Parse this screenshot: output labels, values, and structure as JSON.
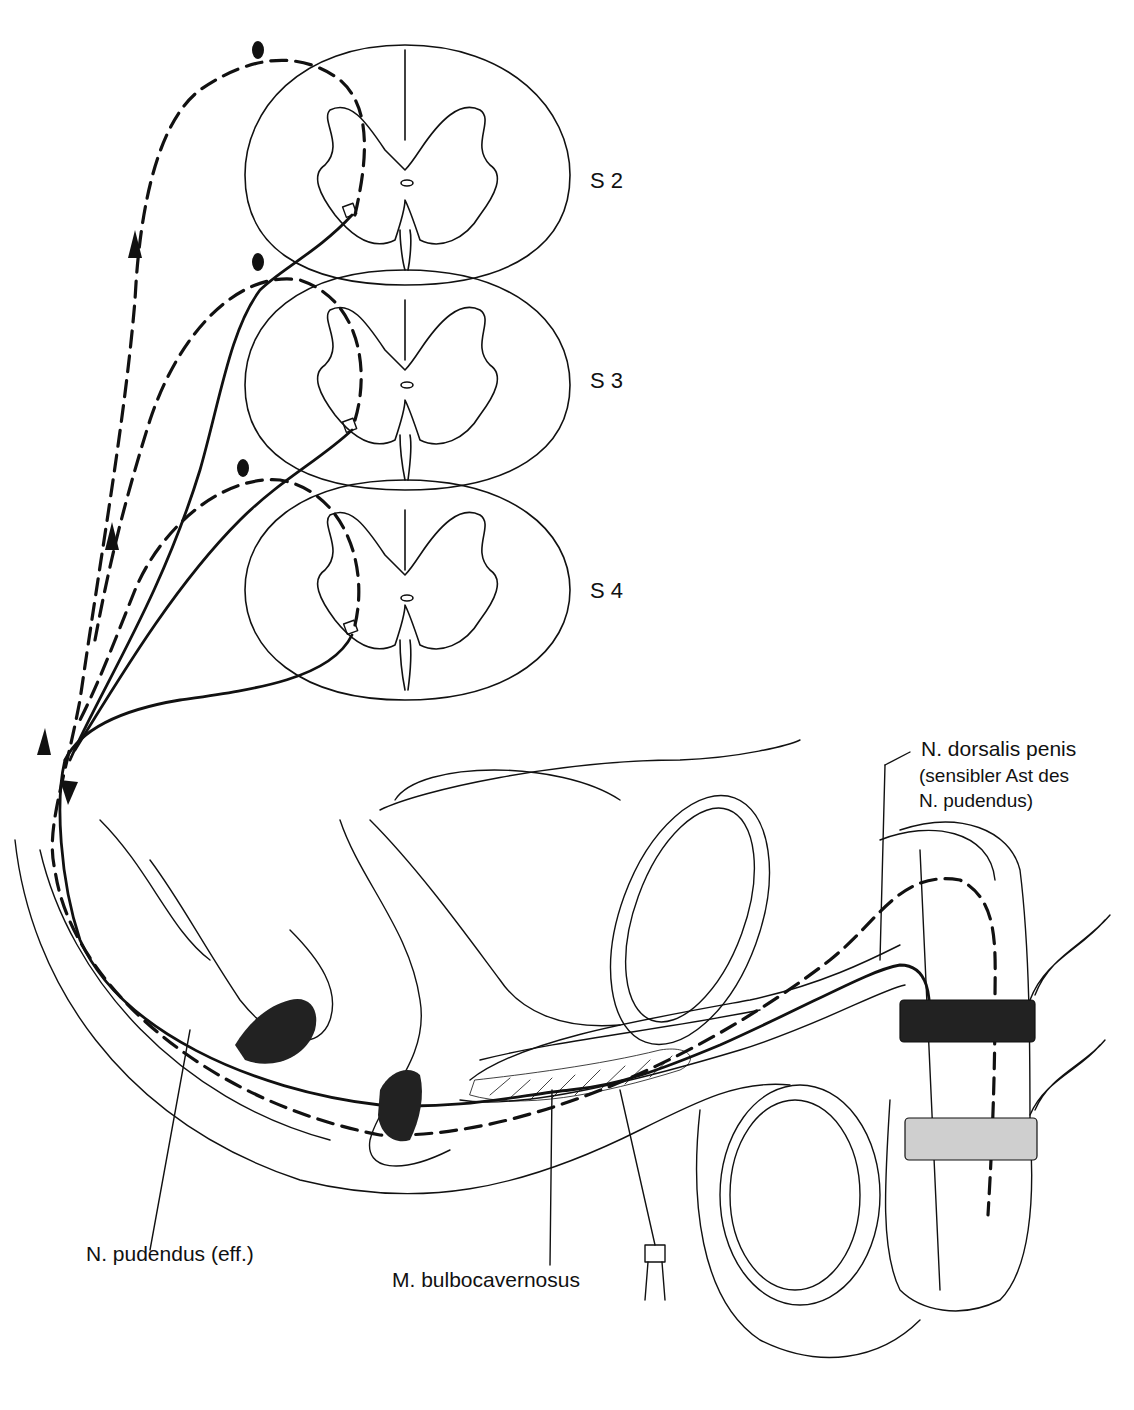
{
  "figure": {
    "type": "anatomical line drawing",
    "colors": {
      "line": "#111111",
      "background": "#ffffff"
    }
  },
  "segments": [
    {
      "id": "s2",
      "label": "S 2"
    },
    {
      "id": "s3",
      "label": "S 3"
    },
    {
      "id": "s4",
      "label": "S 4"
    }
  ],
  "labels": {
    "dorsal_nerve": "N. dorsalis penis",
    "dorsal_nerve_note_line1": "(sensibler Ast des",
    "dorsal_nerve_note_line2": "N. pudendus)",
    "pudendal_efferent": "N. pudendus (eff.)",
    "bulbocavernosus": "M. bulbocavernosus"
  },
  "legend_implicit": {
    "dashed_line": "afferent (sensory) pathway",
    "solid_line": "efferent (motor) pathway"
  }
}
